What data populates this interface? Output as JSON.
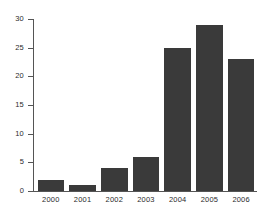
{
  "chart_data": {
    "type": "bar",
    "title": "",
    "subtitle": "",
    "xlabel": "",
    "ylabel": "",
    "categories": [
      "2000",
      "2001",
      "2002",
      "2003",
      "2004",
      "2005",
      "2006"
    ],
    "values": [
      2,
      1,
      4,
      6,
      25,
      29,
      23
    ],
    "series": [
      {
        "name": "",
        "values": [
          2,
          1,
          4,
          6,
          25,
          29,
          23
        ]
      }
    ],
    "ylim": [
      0,
      30
    ],
    "y_ticks": [
      0,
      5,
      10,
      15,
      20,
      25,
      30
    ],
    "y_tick_labels": [
      "0",
      "5",
      "10",
      "15",
      "20",
      "25",
      "30"
    ],
    "x_tick_labels": [
      "2000",
      "2001",
      "2002",
      "2003",
      "2004",
      "2005",
      "2006"
    ],
    "grid": false,
    "legend": false,
    "legend_position": "none",
    "annotations": [],
    "bar_color": "#3a3a3a",
    "axis_color": "#555555",
    "background_color": "#ffffff",
    "tick_label_color": "#2b2b2b"
  }
}
